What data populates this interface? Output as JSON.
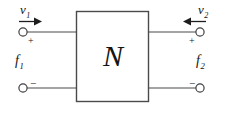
{
  "diagram": {
    "title_element": "two-port-network",
    "network_block": {
      "label": "N",
      "icon": "rectangle-block-icon"
    },
    "ports": {
      "left": {
        "across_variable": {
          "symbol": "v",
          "subscript": "1",
          "arrow_direction": "right",
          "arrow_icon": "arrow-right-icon"
        },
        "through_variable": {
          "symbol": "f",
          "subscript": "1"
        },
        "top_terminal_sign": "+",
        "bottom_terminal_sign": "−",
        "terminal_icon": "terminal-circle-icon"
      },
      "right": {
        "across_variable": {
          "symbol": "v",
          "subscript": "2",
          "arrow_direction": "left",
          "arrow_icon": "arrow-left-icon"
        },
        "through_variable": {
          "symbol": "f",
          "subscript": "2"
        },
        "top_terminal_sign": "+",
        "bottom_terminal_sign": "−",
        "terminal_icon": "terminal-circle-icon"
      }
    },
    "colors": {
      "stroke": "#4a4a4a",
      "text": "#141414",
      "background": "#ffffff"
    }
  }
}
